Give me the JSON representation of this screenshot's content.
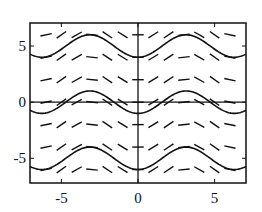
{
  "chart_data": {
    "type": "line",
    "title": "",
    "xlabel": "",
    "ylabel": "",
    "xlim": [
      -7.05,
      7.05
    ],
    "ylim": [
      -7.2,
      7.05
    ],
    "grid": false,
    "legend": null,
    "x_ticks": [
      -5,
      0,
      5
    ],
    "x_tick_labels": [
      "-5",
      "0",
      "5"
    ],
    "y_ticks": [
      -5,
      0,
      5
    ],
    "y_tick_labels": [
      "-5",
      "0",
      "5"
    ],
    "slope_field": {
      "equation": "dy/dx = sin(x)",
      "x_points": [
        -6,
        -5,
        -4,
        -3,
        -2,
        -1,
        0,
        1,
        2,
        3,
        4,
        5,
        6
      ],
      "y_points": [
        -6,
        -4,
        -2,
        0,
        2,
        4,
        6
      ],
      "segment_length": 0.75
    },
    "series": [
      {
        "name": "C=5",
        "formula": "y = 5 - cos(x)",
        "C": 5
      },
      {
        "name": "C=0",
        "formula": "y = -cos(x)",
        "C": 0
      },
      {
        "name": "C=-5",
        "formula": "y = -5 - cos(x)",
        "C": -5
      }
    ],
    "axis_lines": {
      "x_axis_at_y": 0,
      "y_axis_at_x": 0
    }
  },
  "layout": {
    "plot_px": {
      "left": 30,
      "right": 246,
      "top": 23,
      "bottom": 183
    },
    "colors": {
      "ink": "#111111",
      "background": "#ffffff"
    }
  }
}
